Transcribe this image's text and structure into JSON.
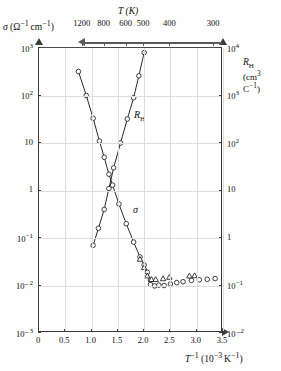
{
  "figure": {
    "material_label": "Si",
    "left_axis_title": "σ (Ω⁻¹ cm⁻¹)",
    "top_axis_title": "T (K)",
    "right_axis_title": "R",
    "right_axis_title_sub": "H",
    "right_axis_unit": "(cm³ C⁻¹)",
    "bottom_axis_title": "T⁻¹ (10⁻³ K⁻¹)",
    "sigma_curve_label": "σ",
    "rh_curve_label": "R",
    "rh_curve_label_sub": "H"
  },
  "axes": {
    "left_ticks": [
      "10³",
      "10²",
      "10",
      "1",
      "10⁻¹",
      "10⁻²",
      "10⁻³"
    ],
    "right_ticks": [
      "10⁴",
      "10³",
      "10²",
      "10",
      "1",
      "10⁻¹",
      "10⁻²"
    ],
    "bottom_ticks": [
      "0",
      "0.5",
      "1.0",
      "1.5",
      "2.0",
      "2.5",
      "3.0",
      "3.5"
    ],
    "top_ticks": [
      "1200",
      "800",
      "600",
      "500",
      "400",
      "300"
    ]
  },
  "chart_data": {
    "type": "scatter",
    "title": "Si",
    "xlabel": "T⁻¹ (10⁻³ K⁻¹)",
    "ylabel": "σ (Ω⁻¹ cm⁻¹)",
    "y2label": "R_H (cm³ C⁻¹)",
    "xlim": [
      0,
      3.5
    ],
    "ylim": [
      0.001,
      1000
    ],
    "y2lim": [
      0.01,
      10000
    ],
    "yscale": "log",
    "y2scale": "log",
    "grid": true,
    "legend": "none",
    "top_axis": {
      "label": "T (K)",
      "direction": "decreasing-right",
      "tick_values_K": [
        1200,
        800,
        600,
        500,
        400,
        300
      ],
      "tick_x_invT": [
        0.833,
        1.25,
        1.667,
        2.0,
        2.5,
        3.333
      ]
    },
    "series": [
      {
        "name": "σ",
        "axis": "left",
        "marker": "open-circle",
        "line": true,
        "x": [
          0.75,
          0.9,
          1.03,
          1.15,
          1.24,
          1.33,
          1.4,
          1.52,
          1.66,
          1.8,
          1.92,
          2.0,
          2.06,
          2.12
        ],
        "y": [
          320,
          100,
          33,
          11,
          5.0,
          2.2,
          1.3,
          0.52,
          0.2,
          0.082,
          0.04,
          0.027,
          0.019,
          0.013
        ]
      },
      {
        "name": "R_H",
        "axis": "right",
        "marker": "open-circle",
        "line": true,
        "x": [
          1.03,
          1.13,
          1.24,
          1.33,
          1.42,
          1.55,
          1.68,
          1.8,
          1.9,
          2.0
        ],
        "y": [
          0.7,
          1.6,
          4.0,
          11,
          30,
          100,
          320,
          900,
          2600,
          8000
        ]
      },
      {
        "name": "extrinsic-circles",
        "axis": "left",
        "marker": "open-circle",
        "line": false,
        "x": [
          2.12,
          2.2,
          2.28,
          2.38,
          2.5,
          2.62,
          2.74,
          2.9,
          3.05,
          3.2,
          3.35
        ],
        "y": [
          0.0105,
          0.0098,
          0.0102,
          0.01,
          0.0108,
          0.0115,
          0.012,
          0.0128,
          0.0132,
          0.0135,
          0.014
        ]
      },
      {
        "name": "extrinsic-triangles",
        "axis": "left",
        "marker": "open-triangle",
        "line": false,
        "x": [
          1.92,
          2.0,
          2.06,
          2.14,
          2.22,
          2.36,
          2.48,
          2.86,
          2.96
        ],
        "y": [
          0.036,
          0.024,
          0.016,
          0.0135,
          0.0135,
          0.014,
          0.015,
          0.016,
          0.0162
        ]
      }
    ]
  }
}
